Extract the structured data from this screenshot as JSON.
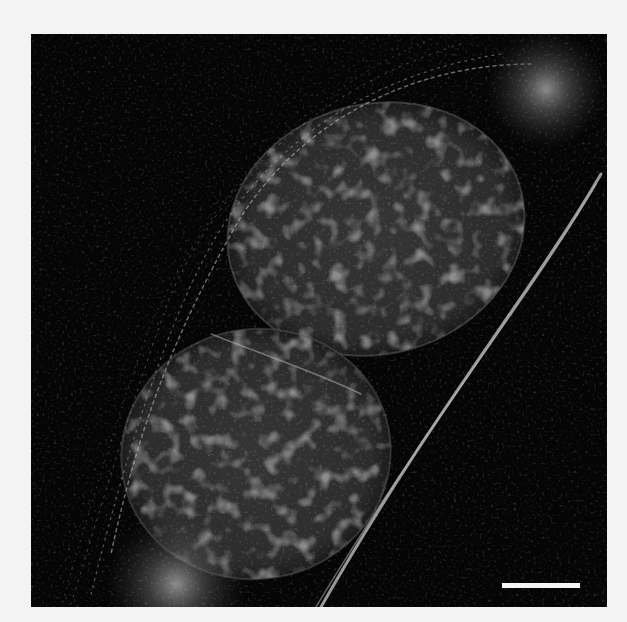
{
  "figure": {
    "type": "fluorescence micrograph",
    "background_color": "#f3f3f3",
    "image_background_color": "#050505",
    "nucleus_color": "#3a3a3a",
    "filament_color": "#cfcfcf",
    "scale_bar": {
      "label": "",
      "color": "#f4f4f4"
    }
  }
}
